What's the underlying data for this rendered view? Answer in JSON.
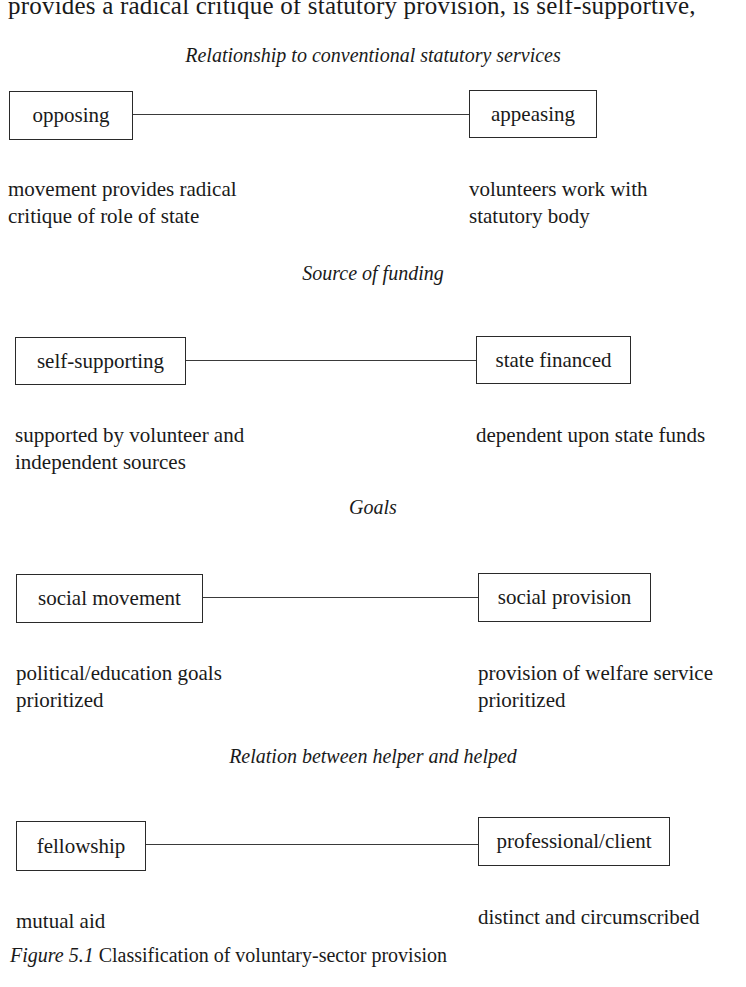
{
  "top_text": "provides a radical critique of statutory provision, is self-supportive,",
  "rows": [
    {
      "caption": "Relationship to conventional statutory services",
      "left_label": "opposing",
      "right_label": "appeasing",
      "left_desc": [
        "movement provides radical",
        "critique of role of state"
      ],
      "right_desc": [
        "volunteers work with",
        "statutory body"
      ]
    },
    {
      "caption": "Source of funding",
      "left_label": "self-supporting",
      "right_label": "state financed",
      "left_desc": [
        "supported by volunteer and",
        "independent sources"
      ],
      "right_desc": [
        "dependent upon state funds"
      ]
    },
    {
      "caption": "Goals",
      "left_label": "social movement",
      "right_label": "social provision",
      "left_desc": [
        "political/education goals",
        "prioritized"
      ],
      "right_desc": [
        "provision of welfare service",
        "prioritized"
      ]
    },
    {
      "caption": "Relation between helper and helped",
      "left_label": "fellowship",
      "right_label": "professional/client",
      "left_desc": [
        "mutual aid"
      ],
      "right_desc": [
        "distinct and circumscribed"
      ]
    }
  ],
  "figure": {
    "label": "Figure 5.1",
    "title": "Classification of voluntary-sector provision"
  }
}
